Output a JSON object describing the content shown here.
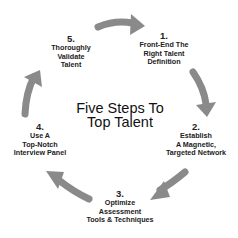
{
  "diagram": {
    "title": [
      "Five Steps To",
      "Top Talent"
    ],
    "arrow_color": "#8a8a8a",
    "steps": [
      {
        "number": "1.",
        "lines": [
          "Front-End The",
          "Right Talent",
          "Definition"
        ]
      },
      {
        "number": "2.",
        "lines": [
          "Establish",
          "A Magnetic,",
          "Targeted Network"
        ]
      },
      {
        "number": "3.",
        "lines": [
          "Optimize",
          "Assessment",
          "Tools & Techniques"
        ]
      },
      {
        "number": "4.",
        "lines": [
          "Use A",
          "Top-Notch",
          "Interview Panel"
        ]
      },
      {
        "number": "5.",
        "lines": [
          "Thoroughly",
          "Validate",
          "Talent"
        ]
      }
    ]
  }
}
